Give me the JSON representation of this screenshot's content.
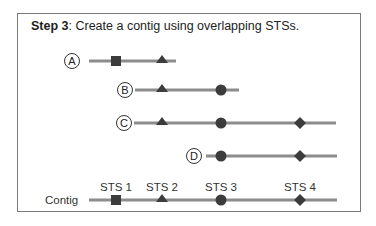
{
  "step": {
    "number_label": "Step 3",
    "description": ": Create a contig using overlapping STSs."
  },
  "colors": {
    "line": "#8c8c8c",
    "marker": "#3c3c3c",
    "border": "#7a7a7a",
    "text": "#222222"
  },
  "clones": [
    {
      "label": "A",
      "line": [
        89,
        176
      ],
      "y": 61,
      "markers": [
        "square",
        "triangle"
      ]
    },
    {
      "label": "B",
      "line": [
        135,
        239
      ],
      "y": 90,
      "markers": [
        "triangle",
        "circle"
      ]
    },
    {
      "label": "C",
      "line": [
        134,
        336
      ],
      "y": 123,
      "markers": [
        "triangle",
        "circle",
        "diamond"
      ]
    },
    {
      "label": "D",
      "line": [
        206,
        337
      ],
      "y": 156,
      "markers": [
        "circle",
        "diamond"
      ]
    }
  ],
  "contig": {
    "label": "Contig",
    "sts": [
      {
        "label": "STS 1",
        "marker": "square",
        "x": 116
      },
      {
        "label": "STS 2",
        "marker": "triangle",
        "x": 162
      },
      {
        "label": "STS 3",
        "marker": "circle",
        "x": 221
      },
      {
        "label": "STS 4",
        "marker": "diamond",
        "x": 300
      }
    ]
  }
}
